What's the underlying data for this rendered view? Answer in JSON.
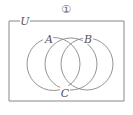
{
  "figure": {
    "number_label": "①",
    "universe_label": "U",
    "sets": [
      {
        "label": "A",
        "cx": 53.5,
        "cy": 64,
        "r": 26.5
      },
      {
        "label": "C",
        "cx": 71,
        "cy": 64,
        "r": 26
      },
      {
        "label": "B",
        "cx": 87,
        "cy": 64,
        "r": 26
      }
    ],
    "colors": {
      "stroke": "#888888",
      "background": "#ffffff"
    }
  }
}
